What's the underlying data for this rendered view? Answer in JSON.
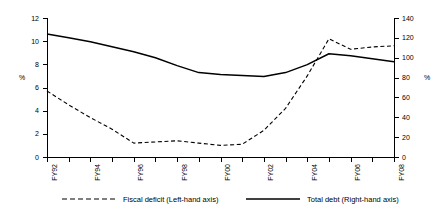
{
  "chart_data": {
    "type": "line",
    "title": "",
    "xlabel": "",
    "ylabel": "%",
    "ylabel_right": "%",
    "grid": false,
    "legend_position": "bottom",
    "x": [
      "FY92",
      "FY93",
      "FY94",
      "FY95",
      "FY96",
      "FY97",
      "FY98",
      "FY99",
      "FY00",
      "FY01",
      "FY02",
      "FY03",
      "FY04",
      "FY05",
      "FY06",
      "FY07",
      "FY08"
    ],
    "xtick_labels": [
      "FY92",
      "FY94",
      "FY96",
      "FY98",
      "FY00",
      "FY02",
      "FY04",
      "FY06",
      "FY08"
    ],
    "ylim": [
      0,
      12
    ],
    "ytick_labels": [
      "0",
      "2",
      "4",
      "6",
      "8",
      "10",
      "12"
    ],
    "ytick_values": [
      0,
      2,
      4,
      6,
      8,
      10,
      12
    ],
    "ylim_right": [
      0,
      140
    ],
    "ytick_labels_right": [
      "0",
      "20",
      "40",
      "60",
      "80",
      "100",
      "120",
      "140"
    ],
    "ytick_values_right": [
      0,
      20,
      40,
      60,
      80,
      100,
      120,
      140
    ],
    "series": [
      {
        "name": "Fiscal deficit (Left-hand axis)",
        "axis": "left",
        "style": "dashed",
        "color": "#000000",
        "values": [
          5.7,
          4.5,
          3.4,
          2.4,
          1.2,
          1.3,
          1.4,
          1.2,
          1.0,
          1.1,
          2.3,
          4.2,
          7.0,
          10.2,
          9.3,
          9.5,
          9.6
        ]
      },
      {
        "name": "Total debt (Right-hand axis)",
        "axis": "right",
        "style": "solid",
        "color": "#000000",
        "values": [
          124,
          120,
          116,
          111,
          106,
          100,
          92,
          85,
          83,
          82,
          81,
          85,
          93,
          104,
          102,
          99,
          96
        ]
      }
    ],
    "series_tail": {
      "note": "values continue to FY08",
      "fiscal_deficit_tail": [
        6.0,
        7.0
      ],
      "total_debt_tail": [
        78,
        80
      ]
    },
    "legend": [
      {
        "label": "Fiscal deficit (Left-hand axis)",
        "style": "dashed"
      },
      {
        "label": "Total debt (Right-hand axis)",
        "style": "solid"
      }
    ]
  },
  "axes": {
    "left_title": "%",
    "right_title": "%"
  }
}
